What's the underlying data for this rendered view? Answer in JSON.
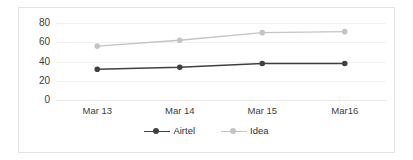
{
  "chart_data": {
    "type": "line",
    "title": "",
    "xlabel": "",
    "ylabel": "",
    "categories": [
      "Mar 13",
      "Mar 14",
      "Mar 15",
      "Mar16"
    ],
    "series": [
      {
        "name": "Airtel",
        "values": [
          32,
          34,
          38,
          38
        ],
        "color": "#404040",
        "marker": "circle"
      },
      {
        "name": "Idea",
        "values": [
          56,
          62,
          70,
          71
        ],
        "color": "#c4c4c4",
        "marker": "circle"
      }
    ],
    "ylim": [
      0,
      80
    ],
    "yticks": [
      0,
      20,
      40,
      60,
      80
    ],
    "ytick_labels": [
      "0",
      "20",
      "40",
      "60",
      "80"
    ],
    "grid": true,
    "legend_position": "bottom"
  },
  "legend": {
    "items": [
      {
        "label": "Airtel",
        "color": "#404040"
      },
      {
        "label": "Idea",
        "color": "#c4c4c4"
      }
    ]
  },
  "colors": {
    "background": "#ffffff",
    "frame": "#e3e3e3",
    "gridline": "#f1f1f1",
    "text": "#404040"
  }
}
